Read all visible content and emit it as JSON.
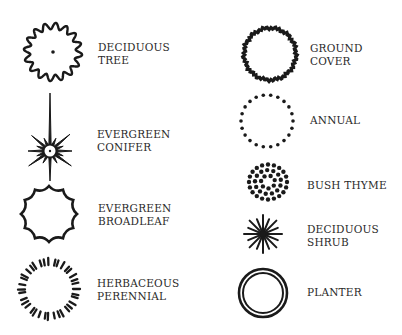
{
  "legend": {
    "items": [
      {
        "id": "deciduous-tree",
        "lines": [
          "DECIDUOUS",
          "TREE"
        ],
        "symbol": "wavy-circle-with-center-dot"
      },
      {
        "id": "evergreen-conifer",
        "lines": [
          "EVERGREEN",
          "CONIFER"
        ],
        "symbol": "star-burst"
      },
      {
        "id": "evergreen-broadleaf",
        "lines": [
          "EVERGREEN",
          "BROADLEAF"
        ],
        "symbol": "scalloped-polygon"
      },
      {
        "id": "herbaceous-perennial",
        "lines": [
          "HERBACEOUS",
          "PERENNIAL"
        ],
        "symbol": "dashed-circle"
      },
      {
        "id": "ground-cover",
        "lines": [
          "GROUND",
          "COVER"
        ],
        "symbol": "rough-circle"
      },
      {
        "id": "annual",
        "lines": [
          "ANNUAL"
        ],
        "symbol": "dotted-circle"
      },
      {
        "id": "bush-thyme",
        "lines": [
          "BUSH THYME"
        ],
        "symbol": "dot-cluster"
      },
      {
        "id": "deciduous-shrub",
        "lines": [
          "DECIDUOUS",
          "SHRUB"
        ],
        "symbol": "radiating-lines"
      },
      {
        "id": "planter",
        "lines": [
          "PLANTER"
        ],
        "symbol": "double-circle"
      }
    ]
  },
  "colors": {
    "ink": "#1a1a1a",
    "background": "#ffffff"
  }
}
